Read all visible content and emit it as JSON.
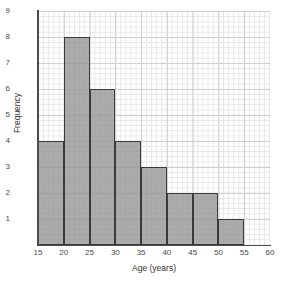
{
  "chart_data": {
    "type": "bar",
    "title": "",
    "subtitle": "",
    "xlabel": "Age (years)",
    "ylabel": "Frequency",
    "xlim": [
      15,
      60
    ],
    "ylim": [
      0,
      9
    ],
    "grid": true,
    "legend": null,
    "bin_width": 5,
    "bins": [
      {
        "start": 15,
        "end": 20,
        "value": 4
      },
      {
        "start": 20,
        "end": 25,
        "value": 8
      },
      {
        "start": 25,
        "end": 30,
        "value": 6
      },
      {
        "start": 30,
        "end": 35,
        "value": 4
      },
      {
        "start": 35,
        "end": 40,
        "value": 3
      },
      {
        "start": 40,
        "end": 45,
        "value": 2
      },
      {
        "start": 45,
        "end": 50,
        "value": 2
      },
      {
        "start": 50,
        "end": 55,
        "value": 1
      }
    ],
    "categories": [
      "15-20",
      "20-25",
      "25-30",
      "30-35",
      "35-40",
      "40-45",
      "45-50",
      "50-55"
    ],
    "values": [
      4,
      8,
      6,
      4,
      3,
      2,
      2,
      1
    ],
    "xticks": [
      "15",
      "20",
      "25",
      "30",
      "35",
      "40",
      "45",
      "50",
      "55",
      "60"
    ],
    "xtick_values": [
      15,
      20,
      25,
      30,
      35,
      40,
      45,
      50,
      55,
      60
    ],
    "yticks": [
      "1",
      "2",
      "3",
      "4",
      "5",
      "6",
      "7",
      "8",
      "9"
    ],
    "ytick_values": [
      1,
      2,
      3,
      4,
      5,
      6,
      7,
      8,
      9
    ],
    "colors": {
      "bar_fill": "#969696",
      "bar_edge": "#3a3a3a",
      "grid_minor": "#e6e6e6",
      "grid_major": "#cfcfcf",
      "axis": "#4a4a4a",
      "text": "#333333",
      "background": "#ffffff"
    }
  }
}
